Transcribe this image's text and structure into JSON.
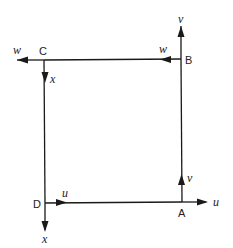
{
  "diagram": {
    "type": "square-circuit-with-vector-labels",
    "colors": {
      "line": "#1a1a1a",
      "text": "#222222",
      "background": "#ffffff"
    },
    "corners": {
      "A": {
        "label": "A",
        "x": 182,
        "y": 202
      },
      "B": {
        "label": "B",
        "x": 181,
        "y": 59
      },
      "C": {
        "label": "C",
        "x": 44,
        "y": 60
      },
      "D": {
        "label": "D",
        "x": 45,
        "y": 203
      }
    },
    "edges": [
      {
        "from": "C",
        "to": "D",
        "arrow_label": "x",
        "direction": "down"
      },
      {
        "from": "B",
        "to": "C",
        "arrow_label": "w",
        "direction": "left"
      },
      {
        "from": "D",
        "to": "A",
        "arrow_label": "u",
        "direction": "right"
      },
      {
        "from": "A",
        "to": "B",
        "arrow_label": "v",
        "direction": "up"
      }
    ],
    "external_arrows": [
      {
        "at": "B",
        "label": "v",
        "direction": "up"
      },
      {
        "at": "C",
        "label": "w",
        "direction": "left"
      },
      {
        "at": "D",
        "label": "x",
        "direction": "down"
      },
      {
        "at": "A",
        "label": "u",
        "direction": "right"
      }
    ],
    "labels": {
      "corner_a": "A",
      "corner_b": "B",
      "corner_c": "C",
      "corner_d": "D",
      "edge_cd": "x",
      "edge_bc": "w",
      "edge_da": "u",
      "edge_ab": "v",
      "ext_b": "v",
      "ext_c": "w",
      "ext_d": "x",
      "ext_a": "u"
    }
  }
}
